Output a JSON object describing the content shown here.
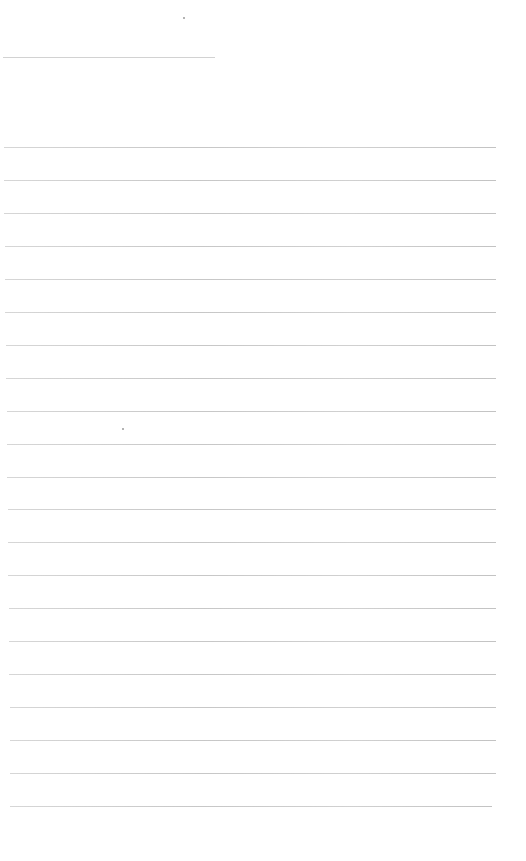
{
  "document": {
    "header": {
      "text": "",
      "y": 57,
      "x": 3,
      "width": 212
    },
    "top_mark": {
      "x": 183,
      "y": 17
    },
    "mid_mark": {
      "x": 122,
      "y": 428
    },
    "lines": [
      {
        "y": 147,
        "x": 4,
        "w": 492
      },
      {
        "y": 180,
        "x": 4,
        "w": 492
      },
      {
        "y": 213,
        "x": 4,
        "w": 492
      },
      {
        "y": 246,
        "x": 5,
        "w": 491
      },
      {
        "y": 279,
        "x": 5,
        "w": 491
      },
      {
        "y": 312,
        "x": 5,
        "w": 491
      },
      {
        "y": 345,
        "x": 6,
        "w": 490
      },
      {
        "y": 378,
        "x": 6,
        "w": 490
      },
      {
        "y": 411,
        "x": 7,
        "w": 489
      },
      {
        "y": 444,
        "x": 7,
        "w": 489
      },
      {
        "y": 477,
        "x": 7,
        "w": 489
      },
      {
        "y": 509,
        "x": 8,
        "w": 488
      },
      {
        "y": 542,
        "x": 8,
        "w": 488
      },
      {
        "y": 575,
        "x": 8,
        "w": 488
      },
      {
        "y": 608,
        "x": 9,
        "w": 487
      },
      {
        "y": 641,
        "x": 9,
        "w": 487
      },
      {
        "y": 674,
        "x": 9,
        "w": 487
      },
      {
        "y": 707,
        "x": 10,
        "w": 486
      },
      {
        "y": 740,
        "x": 10,
        "w": 486
      },
      {
        "y": 773,
        "x": 10,
        "w": 486
      },
      {
        "y": 806,
        "x": 10,
        "w": 482
      }
    ]
  }
}
